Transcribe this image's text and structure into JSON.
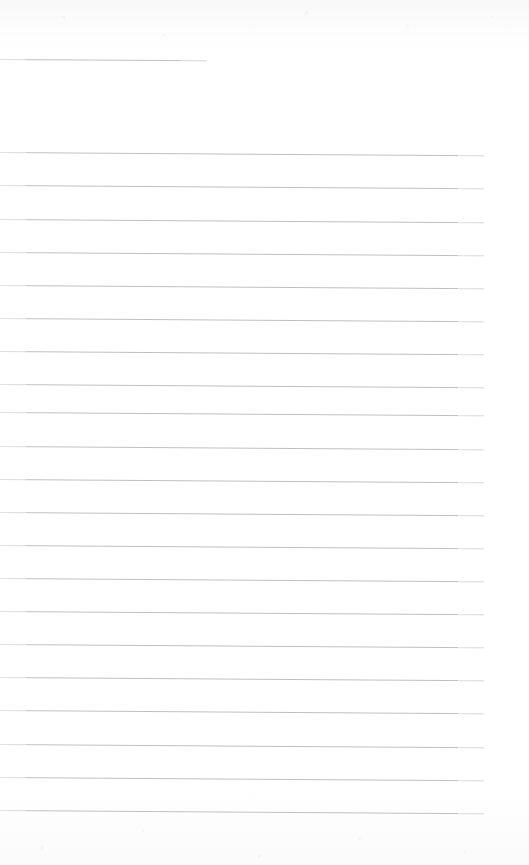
{
  "document": {
    "kind": "scanned-lined-page",
    "title": "",
    "page_width": 529,
    "page_height": 865,
    "background_color": "#ffffff",
    "rule_color": "#b9bdc2",
    "rule_thickness_px": 1,
    "rule_spacing_px": 33.2,
    "rule_skew_deg": 0.38,
    "body_text": "",
    "header_text": "",
    "footer_text": ""
  },
  "rules": [
    {
      "index": 1,
      "y": 59,
      "x_start": 0,
      "x_end": 207,
      "kind": "short",
      "label": ""
    },
    {
      "index": 2,
      "y": 152,
      "x_start": 0,
      "x_end": 484,
      "kind": "full",
      "label": ""
    },
    {
      "index": 3,
      "y": 185,
      "x_start": 0,
      "x_end": 484,
      "kind": "full",
      "label": ""
    },
    {
      "index": 4,
      "y": 219,
      "x_start": 0,
      "x_end": 484,
      "kind": "full",
      "label": ""
    },
    {
      "index": 5,
      "y": 252,
      "x_start": 0,
      "x_end": 484,
      "kind": "full",
      "label": ""
    },
    {
      "index": 6,
      "y": 285,
      "x_start": 0,
      "x_end": 484,
      "kind": "full",
      "label": ""
    },
    {
      "index": 7,
      "y": 318,
      "x_start": 0,
      "x_end": 484,
      "kind": "full",
      "label": ""
    },
    {
      "index": 8,
      "y": 351,
      "x_start": 0,
      "x_end": 484,
      "kind": "full",
      "label": ""
    },
    {
      "index": 9,
      "y": 384,
      "x_start": 0,
      "x_end": 484,
      "kind": "full",
      "label": ""
    },
    {
      "index": 10,
      "y": 412,
      "x_start": 0,
      "x_end": 484,
      "kind": "full",
      "label": ""
    },
    {
      "index": 11,
      "y": 446,
      "x_start": 0,
      "x_end": 484,
      "kind": "full",
      "label": ""
    },
    {
      "index": 12,
      "y": 479,
      "x_start": 0,
      "x_end": 484,
      "kind": "full",
      "label": ""
    },
    {
      "index": 13,
      "y": 512,
      "x_start": 0,
      "x_end": 484,
      "kind": "full",
      "label": ""
    },
    {
      "index": 14,
      "y": 545,
      "x_start": 0,
      "x_end": 484,
      "kind": "full",
      "label": ""
    },
    {
      "index": 15,
      "y": 578,
      "x_start": 0,
      "x_end": 484,
      "kind": "full",
      "label": ""
    },
    {
      "index": 16,
      "y": 611,
      "x_start": 0,
      "x_end": 484,
      "kind": "full",
      "label": ""
    },
    {
      "index": 17,
      "y": 644,
      "x_start": 0,
      "x_end": 484,
      "kind": "full",
      "label": ""
    },
    {
      "index": 18,
      "y": 677,
      "x_start": 0,
      "x_end": 484,
      "kind": "full",
      "label": ""
    },
    {
      "index": 19,
      "y": 710,
      "x_start": 0,
      "x_end": 484,
      "kind": "full",
      "label": ""
    },
    {
      "index": 20,
      "y": 744,
      "x_start": 0,
      "x_end": 484,
      "kind": "full",
      "label": ""
    },
    {
      "index": 21,
      "y": 777,
      "x_start": 0,
      "x_end": 484,
      "kind": "full",
      "label": ""
    },
    {
      "index": 22,
      "y": 810,
      "x_start": 0,
      "x_end": 484,
      "kind": "full",
      "label": ""
    }
  ]
}
